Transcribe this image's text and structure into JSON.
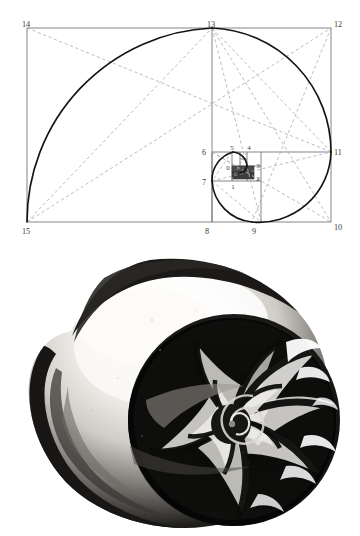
{
  "page": {
    "background_color": "#ffffff",
    "width": 360,
    "height": 536
  },
  "figures": [
    {
      "id": "golden-spiral-diagram",
      "type": "geometric-construction",
      "caption": "",
      "description": "Golden / Fibonacci spiral constructed from nested squares inside a golden rectangle, with numbered vertices and dashed diagonal construction lines.",
      "stroke_color": "#6e6e6e",
      "spiral_color": "#1a1a1a",
      "dash_color": "#9a9a9a",
      "fill_block_color": "#4a4a4a",
      "vertex_labels": [
        {
          "id": "0",
          "text": "0",
          "x": 228,
          "y": 169
        },
        {
          "id": "1",
          "text": "1",
          "x": 234,
          "y": 186
        },
        {
          "id": "2",
          "text": "2",
          "x": 258,
          "y": 180
        },
        {
          "id": "3",
          "text": "3",
          "x": 258,
          "y": 166
        },
        {
          "id": "4",
          "text": "4",
          "x": 250,
          "y": 150
        },
        {
          "id": "5",
          "text": "5",
          "x": 233,
          "y": 149
        },
        {
          "id": "6",
          "text": "6",
          "x": 198,
          "y": 155
        },
        {
          "id": "7",
          "text": "7",
          "x": 198,
          "y": 184
        },
        {
          "id": "8",
          "text": "8",
          "x": 204,
          "y": 230
        },
        {
          "id": "9",
          "text": "9",
          "x": 252,
          "y": 230
        },
        {
          "id": "10",
          "text": "10",
          "x": 336,
          "y": 229
        },
        {
          "id": "11",
          "text": "11",
          "x": 336,
          "y": 155
        },
        {
          "id": "12",
          "text": "12",
          "x": 336,
          "y": 27
        },
        {
          "id": "13",
          "text": "13",
          "x": 207,
          "y": 27
        },
        {
          "id": "14",
          "text": "14",
          "x": 22,
          "y": 27
        },
        {
          "id": "15",
          "text": "15",
          "x": 22,
          "y": 231
        }
      ]
    },
    {
      "id": "nautilus-shell-photograph",
      "type": "photograph",
      "caption": "",
      "description": "Black-and-white photograph of a cut nautilus shell showing the logarithmic spiral of its internal chambers.",
      "palette": {
        "dark": "#141414",
        "mid": "#5a5a5a",
        "light": "#e8e6e2",
        "highlight": "#ffffff"
      }
    }
  ]
}
